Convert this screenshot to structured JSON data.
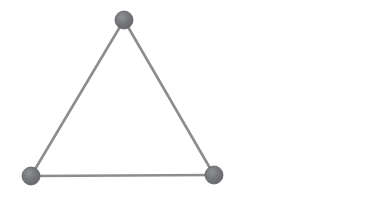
{
  "canvas": {
    "width": 371,
    "height": 208,
    "background_color": "#ffffff"
  },
  "diagram": {
    "type": "node-link-graph",
    "shape": "triangle",
    "node_count": 3,
    "edge_count": 3,
    "node_radius": 9,
    "node_fill_color": "#707275",
    "node_highlight_color": "#8d9094",
    "node_stroke_color": "#5e6063",
    "edge_color": "#8b8d8f",
    "edge_width": 2.6,
    "nodes": [
      {
        "id": "top",
        "label": "",
        "cx": 124,
        "cy": 20
      },
      {
        "id": "bottom-left",
        "label": "",
        "cx": 31,
        "cy": 176
      },
      {
        "id": "bottom-right",
        "label": "",
        "cx": 214,
        "cy": 175
      }
    ],
    "edges": [
      {
        "id": "edge-top-left",
        "from": "top",
        "to": "bottom-left"
      },
      {
        "id": "edge-top-right",
        "from": "top",
        "to": "bottom-right"
      },
      {
        "id": "edge-bottom-base",
        "from": "bottom-left",
        "to": "bottom-right"
      }
    ]
  }
}
